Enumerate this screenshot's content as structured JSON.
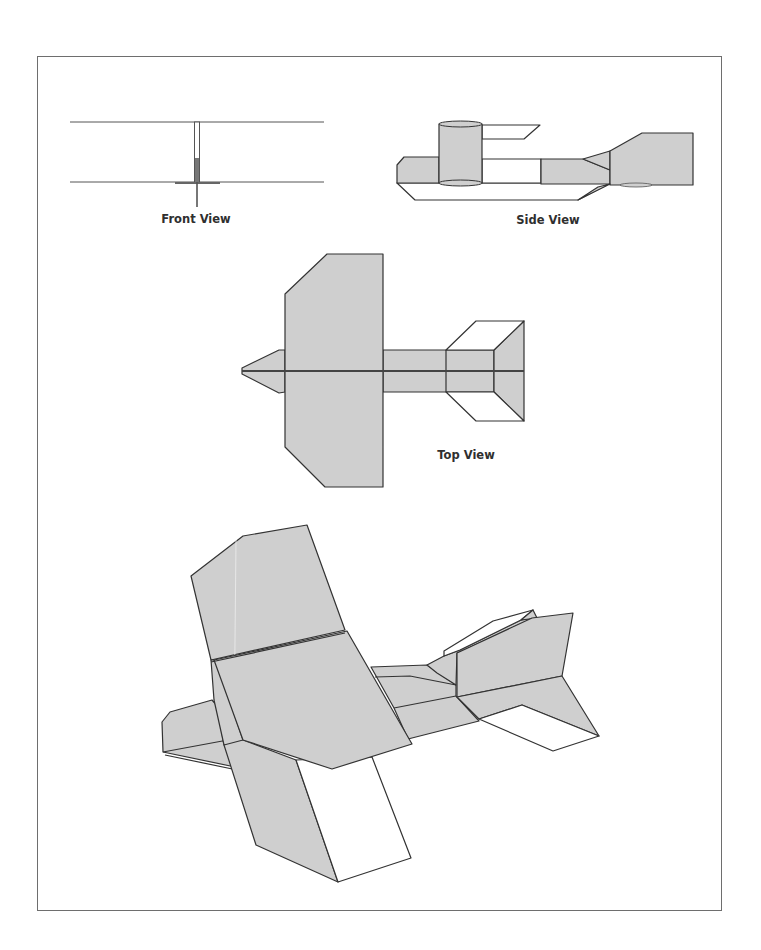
{
  "figure": {
    "colors": {
      "fill_gray": "#cfcfcf",
      "outline": "#333333",
      "frame": "#6e6e6e",
      "label_text": "#2f2f2f"
    },
    "views": [
      {
        "id": "front",
        "label": "Front View"
      },
      {
        "id": "side",
        "label": "Side View"
      },
      {
        "id": "top",
        "label": "Top View"
      },
      {
        "id": "perspective",
        "label": ""
      }
    ]
  }
}
